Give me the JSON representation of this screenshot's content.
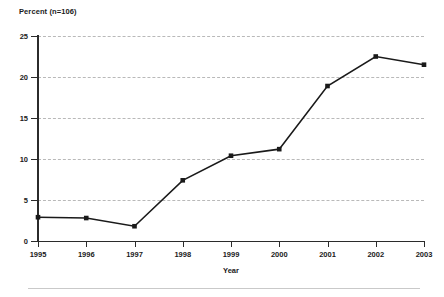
{
  "chart_data": {
    "type": "line",
    "title": "",
    "ylabel": "Percent (n=106)",
    "xlabel": "Year",
    "categories": [
      "1995",
      "1996",
      "1997",
      "1998",
      "1999",
      "2000",
      "2001",
      "2002",
      "2003"
    ],
    "x": [
      1995,
      1996,
      1997,
      1998,
      1999,
      2000,
      2001,
      2002,
      2003
    ],
    "values": [
      2.9,
      2.8,
      1.8,
      7.4,
      10.4,
      11.2,
      18.9,
      22.5,
      21.5
    ],
    "series": [
      {
        "name": "Percent",
        "values": [
          2.9,
          2.8,
          1.8,
          7.4,
          10.4,
          11.2,
          18.9,
          22.5,
          21.5
        ]
      }
    ],
    "ylim": [
      0,
      25
    ],
    "yticks": [
      0,
      5,
      10,
      15,
      20,
      25
    ],
    "ytick_labels": [
      "0",
      "5",
      "10",
      "15",
      "20",
      "25"
    ],
    "xlim": [
      1995,
      2003
    ],
    "grid": "horizontal-dashed",
    "legend": "none",
    "line_color": "#1a1a1a",
    "marker": "square",
    "marker_color": "#1a1a1a",
    "grid_color": "#b9b9b9",
    "axis_color": "#2b2b2b",
    "background": "#ffffff"
  },
  "axes": {
    "y_title": "Percent (n=106)",
    "x_title": "Year"
  }
}
